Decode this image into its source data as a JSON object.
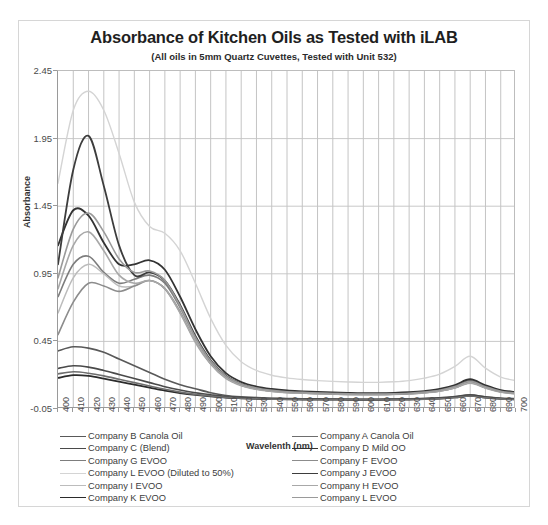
{
  "chart_data": {
    "type": "line",
    "title": "Absorbance of Kitchen Oils as Tested with iLAB",
    "subtitle": "(All oils in 5mm Quartz Cuvettes, Tested with Unit 532)",
    "xlabel": "Wavelenth (nm)",
    "ylabel": "Absorbance",
    "xlim": [
      400,
      700
    ],
    "ylim": [
      -0.05,
      2.45
    ],
    "ytick_values": [
      -0.05,
      0.45,
      0.95,
      1.45,
      1.95,
      2.45
    ],
    "ytick_labels": [
      "-0.05",
      "0.45",
      "0.95",
      "1.45",
      "1.95",
      "2.45"
    ],
    "x": [
      400,
      410,
      420,
      430,
      440,
      450,
      460,
      470,
      480,
      490,
      500,
      510,
      520,
      530,
      540,
      550,
      560,
      570,
      580,
      590,
      600,
      610,
      620,
      630,
      640,
      650,
      660,
      670,
      680,
      690,
      700
    ],
    "xtick_labels": [
      "400",
      "410",
      "420",
      "430",
      "440",
      "450",
      "460",
      "470",
      "480",
      "490",
      "500",
      "510",
      "520",
      "530",
      "540",
      "550",
      "560",
      "570",
      "580",
      "590",
      "600",
      "610",
      "620",
      "630",
      "640",
      "650",
      "660",
      "670",
      "680",
      "690",
      "700"
    ],
    "grid": true,
    "legend_position": "bottom",
    "series": [
      {
        "name": "Company B Canola Oil",
        "color": "#595959",
        "width": 1.6,
        "values": [
          0.38,
          0.41,
          0.4,
          0.37,
          0.32,
          0.27,
          0.22,
          0.17,
          0.13,
          0.1,
          0.07,
          0.05,
          0.04,
          0.035,
          0.03,
          0.028,
          0.026,
          0.025,
          0.024,
          0.023,
          0.022,
          0.022,
          0.023,
          0.025,
          0.028,
          0.033,
          0.042,
          0.055,
          0.04,
          0.03,
          0.026
        ]
      },
      {
        "name": "Company C (Blend)",
        "color": "#4a4a4a",
        "width": 1.6,
        "values": [
          0.25,
          0.27,
          0.26,
          0.235,
          0.205,
          0.175,
          0.145,
          0.115,
          0.09,
          0.07,
          0.055,
          0.042,
          0.035,
          0.03,
          0.027,
          0.025,
          0.024,
          0.023,
          0.022,
          0.021,
          0.021,
          0.021,
          0.022,
          0.024,
          0.027,
          0.032,
          0.041,
          0.053,
          0.039,
          0.029,
          0.025
        ]
      },
      {
        "name": "Company G EVOO",
        "color": "#7d7d7d",
        "width": 1.6,
        "values": [
          0.78,
          1.02,
          1.08,
          0.96,
          0.88,
          0.91,
          0.94,
          0.88,
          0.7,
          0.48,
          0.3,
          0.19,
          0.13,
          0.1,
          0.085,
          0.075,
          0.07,
          0.066,
          0.063,
          0.06,
          0.058,
          0.058,
          0.06,
          0.064,
          0.072,
          0.086,
          0.112,
          0.15,
          0.11,
          0.078,
          0.065
        ]
      },
      {
        "name": "Company L EVOO (Diluted to 50%)",
        "color": "#d4d4d4",
        "width": 1.4,
        "values": [
          1.62,
          2.16,
          2.3,
          2.16,
          1.84,
          1.48,
          1.3,
          1.25,
          1.12,
          0.88,
          0.62,
          0.42,
          0.3,
          0.235,
          0.2,
          0.18,
          0.168,
          0.16,
          0.154,
          0.15,
          0.147,
          0.147,
          0.151,
          0.16,
          0.178,
          0.208,
          0.265,
          0.34,
          0.252,
          0.186,
          0.16
        ]
      },
      {
        "name": "Company I EVOO",
        "color": "#bcbcbc",
        "width": 1.5,
        "values": [
          0.66,
          0.92,
          1.02,
          0.95,
          0.86,
          0.86,
          0.9,
          0.84,
          0.66,
          0.44,
          0.28,
          0.175,
          0.122,
          0.095,
          0.08,
          0.071,
          0.066,
          0.062,
          0.059,
          0.057,
          0.055,
          0.055,
          0.057,
          0.061,
          0.068,
          0.081,
          0.105,
          0.141,
          0.104,
          0.074,
          0.062
        ]
      },
      {
        "name": "Company K EVOO",
        "color": "#2b2b2b",
        "width": 1.7,
        "values": [
          0.18,
          0.2,
          0.195,
          0.175,
          0.152,
          0.13,
          0.108,
          0.086,
          0.068,
          0.054,
          0.043,
          0.034,
          0.029,
          0.025,
          0.023,
          0.021,
          0.02,
          0.019,
          0.019,
          0.018,
          0.018,
          0.018,
          0.019,
          0.02,
          0.023,
          0.027,
          0.035,
          0.046,
          0.034,
          0.025,
          0.021
        ]
      },
      {
        "name": "Company A Canola Oil",
        "color": "#6e6e6e",
        "width": 1.6,
        "values": [
          0.21,
          0.225,
          0.215,
          0.195,
          0.17,
          0.145,
          0.12,
          0.096,
          0.075,
          0.058,
          0.046,
          0.036,
          0.03,
          0.026,
          0.023,
          0.022,
          0.021,
          0.02,
          0.019,
          0.019,
          0.018,
          0.018,
          0.019,
          0.021,
          0.023,
          0.027,
          0.035,
          0.046,
          0.034,
          0.025,
          0.021
        ]
      },
      {
        "name": "Company D Mild OO",
        "color": "#333333",
        "width": 1.8,
        "values": [
          1.16,
          1.42,
          1.38,
          1.18,
          1.02,
          1.02,
          1.05,
          0.98,
          0.78,
          0.54,
          0.34,
          0.215,
          0.15,
          0.116,
          0.098,
          0.087,
          0.081,
          0.076,
          0.072,
          0.069,
          0.067,
          0.067,
          0.069,
          0.074,
          0.083,
          0.098,
          0.127,
          0.17,
          0.125,
          0.09,
          0.075
        ]
      },
      {
        "name": "Company F EVOO",
        "color": "#8c8c8c",
        "width": 1.6,
        "values": [
          0.5,
          0.74,
          0.88,
          0.86,
          0.82,
          0.86,
          0.9,
          0.84,
          0.67,
          0.45,
          0.285,
          0.18,
          0.126,
          0.098,
          0.082,
          0.073,
          0.068,
          0.064,
          0.061,
          0.058,
          0.057,
          0.057,
          0.059,
          0.063,
          0.07,
          0.083,
          0.108,
          0.145,
          0.107,
          0.076,
          0.063
        ]
      },
      {
        "name": "Company J EVOO",
        "color": "#3d3d3d",
        "width": 1.8,
        "values": [
          1.02,
          1.72,
          1.97,
          1.6,
          1.16,
          0.94,
          0.96,
          0.9,
          0.72,
          0.49,
          0.31,
          0.196,
          0.137,
          0.106,
          0.089,
          0.079,
          0.074,
          0.069,
          0.066,
          0.063,
          0.062,
          0.062,
          0.064,
          0.068,
          0.076,
          0.09,
          0.117,
          0.157,
          0.115,
          0.082,
          0.068
        ]
      },
      {
        "name": "Company H EVOO",
        "color": "#a8a8a8",
        "width": 1.6,
        "values": [
          0.84,
          1.16,
          1.26,
          1.12,
          0.94,
          0.88,
          0.9,
          0.84,
          0.66,
          0.45,
          0.285,
          0.18,
          0.126,
          0.098,
          0.082,
          0.073,
          0.068,
          0.064,
          0.061,
          0.058,
          0.057,
          0.057,
          0.059,
          0.063,
          0.07,
          0.083,
          0.108,
          0.145,
          0.107,
          0.076,
          0.063
        ]
      },
      {
        "name": "Company L EVOO",
        "color": "#9a9a9a",
        "width": 1.6,
        "values": [
          0.92,
          1.28,
          1.4,
          1.26,
          1.06,
          0.96,
          0.97,
          0.9,
          0.71,
          0.48,
          0.305,
          0.193,
          0.135,
          0.105,
          0.088,
          0.078,
          0.073,
          0.068,
          0.065,
          0.062,
          0.061,
          0.061,
          0.063,
          0.067,
          0.075,
          0.089,
          0.116,
          0.155,
          0.114,
          0.081,
          0.067
        ]
      }
    ],
    "legend_left": [
      "Company B Canola Oil",
      "Company C (Blend)",
      "Company G EVOO",
      "Company L EVOO (Diluted to 50%)",
      "Company I EVOO",
      "Company K EVOO"
    ],
    "legend_right": [
      "Company A Canola Oil",
      "Company D Mild OO",
      "Company F EVOO",
      "Company J EVOO",
      "Company H EVOO",
      "Company L EVOO"
    ]
  }
}
